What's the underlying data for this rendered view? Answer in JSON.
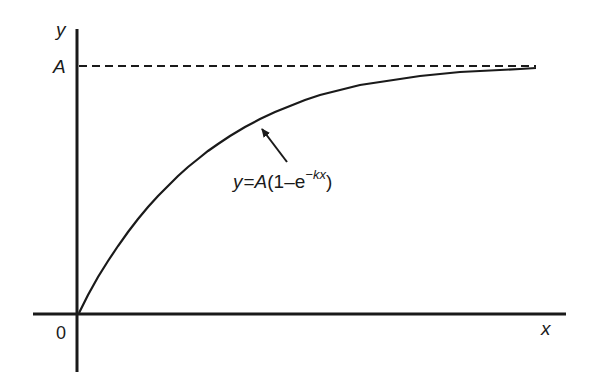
{
  "diagram": {
    "y_axis_label": "y",
    "x_axis_label": "x",
    "asymptote_label": "A",
    "origin_label": "0",
    "equation": {
      "lhs": "y",
      "equals": "=",
      "A": "A",
      "open": "(1–e",
      "exponent": "−kx",
      "close": ")"
    },
    "colors": {
      "ink": "#1a1a1a",
      "background": "#ffffff"
    }
  }
}
